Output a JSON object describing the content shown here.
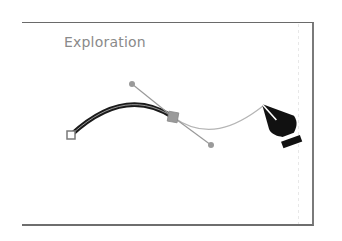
{
  "artboard": {
    "label": "Exploration"
  },
  "canvas": {
    "path": {
      "start_anchor": {
        "x": 71,
        "y": 135,
        "style": "hollow-square"
      },
      "smooth_anchor": {
        "x": 173,
        "y": 117,
        "style": "filled-square"
      },
      "handle_in": {
        "x": 132,
        "y": 84
      },
      "handle_out": {
        "x": 211,
        "y": 145
      },
      "preview_end": {
        "x": 263,
        "y": 106
      }
    },
    "tool": "pen-tool"
  },
  "colors": {
    "stroke": "#1a1a1a",
    "stroke_highlight": "#bbbbbb",
    "handle": "#9a9a9a",
    "preview": "#b5b5b5",
    "anchor_fill": "#9a9a9a",
    "label": "#8a8a8a",
    "strip": "#4a4a4a"
  }
}
